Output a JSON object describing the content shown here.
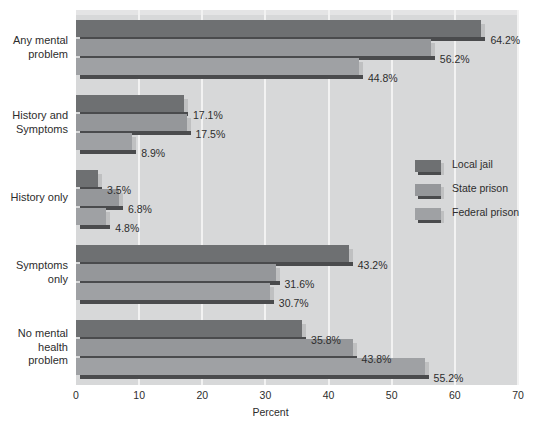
{
  "chart_data": {
    "type": "bar",
    "orientation": "horizontal",
    "title": "",
    "xlabel": "Percent",
    "ylabel": "",
    "xlim": [
      0,
      70
    ],
    "xticks": [
      0,
      10,
      20,
      30,
      40,
      50,
      60,
      70
    ],
    "grid": true,
    "legend_position": "middle-right",
    "categories": [
      "Any mental problem",
      "History and Symptoms",
      "History only",
      "Symptoms only",
      "No mental health problem"
    ],
    "category_lines": [
      [
        "Any mental",
        "problem"
      ],
      [
        "History and",
        "Symptoms"
      ],
      [
        "History only"
      ],
      [
        "Symptoms",
        "only"
      ],
      [
        "No mental",
        "health",
        "problem"
      ]
    ],
    "series": [
      {
        "name": "Local jail",
        "color": "#6e7072",
        "values": [
          64.2,
          17.1,
          3.5,
          43.2,
          35.8
        ],
        "labels": [
          "64.2%",
          "17.1%",
          "3.5%",
          "43.2%",
          "35.8%"
        ]
      },
      {
        "name": "State prison",
        "color": "#95979a",
        "values": [
          56.2,
          17.5,
          6.8,
          31.6,
          43.8
        ],
        "labels": [
          "56.2%",
          "17.5%",
          "6.8%",
          "31.6%",
          "43.8%"
        ]
      },
      {
        "name": "Federal prison",
        "color": "#9fa1a4",
        "values": [
          44.8,
          8.9,
          4.8,
          30.7,
          55.2
        ],
        "labels": [
          "44.8%",
          "8.9%",
          "4.8%",
          "30.7%",
          "55.2%"
        ]
      }
    ]
  },
  "legend": {
    "items": [
      {
        "label": "Local jail",
        "color": "#6e7072"
      },
      {
        "label": "State prison",
        "color": "#95979a"
      },
      {
        "label": "Federal prison",
        "color": "#9fa1a4"
      }
    ]
  },
  "axis": {
    "x_title": "Percent",
    "x_tick_labels": [
      "0",
      "10",
      "20",
      "30",
      "40",
      "50",
      "60",
      "70"
    ]
  },
  "colors": {
    "plot_background": "#d7d8d9",
    "gridline": "#f2f2f2",
    "bar_shadow": "#4a4b4d",
    "bar_cap": "#bfc0c1",
    "text": "#2d2d2d",
    "page_background": "#ffffff"
  }
}
